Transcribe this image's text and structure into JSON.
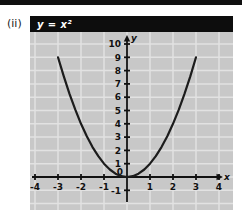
{
  "figure_label": "(ii)",
  "panel": {
    "title": "y = x²"
  },
  "chart_data": {
    "type": "line",
    "title": "y = x²",
    "equation": "y = x^2",
    "xlabel": "x",
    "ylabel": "y",
    "xlim": [
      -4.3,
      4.6
    ],
    "ylim": [
      -2.5,
      10.9
    ],
    "x_ticks": [
      -4,
      -3,
      -2,
      -1,
      0,
      1,
      2,
      3,
      4
    ],
    "y_ticks": [
      -1,
      0,
      1,
      2,
      3,
      4,
      5,
      6,
      7,
      8,
      9,
      10
    ],
    "grid": true,
    "grid_x": [
      -4,
      -3,
      -2,
      -1,
      0,
      1,
      2,
      3,
      4
    ],
    "grid_y": [
      -2,
      -1,
      0,
      1,
      2,
      3,
      4,
      5,
      6,
      7,
      8,
      9,
      10
    ],
    "series": [
      {
        "name": "y = x²",
        "points": [
          [
            -3,
            9
          ],
          [
            -2.75,
            7.5625
          ],
          [
            -2.5,
            6.25
          ],
          [
            -2.25,
            5.0625
          ],
          [
            -2,
            4
          ],
          [
            -1.75,
            3.0625
          ],
          [
            -1.5,
            2.25
          ],
          [
            -1.25,
            1.5625
          ],
          [
            -1,
            1
          ],
          [
            -0.75,
            0.5625
          ],
          [
            -0.5,
            0.25
          ],
          [
            -0.25,
            0.0625
          ],
          [
            0,
            0
          ],
          [
            0.25,
            0.0625
          ],
          [
            0.5,
            0.25
          ],
          [
            0.75,
            0.5625
          ],
          [
            1,
            1
          ],
          [
            1.25,
            1.5625
          ],
          [
            1.5,
            2.25
          ],
          [
            1.75,
            3.0625
          ],
          [
            2,
            4
          ],
          [
            2.25,
            5.0625
          ],
          [
            2.5,
            6.25
          ],
          [
            2.75,
            7.5625
          ],
          [
            3,
            9
          ]
        ]
      }
    ],
    "colors": {
      "curve": "#1c1c1c",
      "axis": "#111111",
      "grid": "#e2e2e2",
      "plot_bg": "#c8c8c8",
      "title_bg": "#0d0d0d",
      "title_fg": "#ffffff",
      "label": "#111111"
    }
  }
}
